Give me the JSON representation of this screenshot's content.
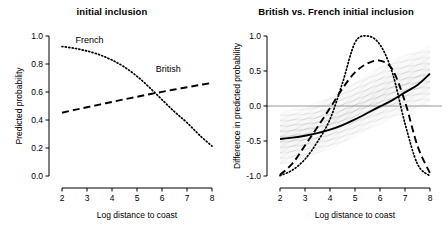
{
  "figure": {
    "background": "#ffffff",
    "panel_count": 2
  },
  "chart_data": [
    {
      "type": "line",
      "panel": "left",
      "title": "initial inclusion",
      "xlabel": "Log distance to coast",
      "ylabel": "Predicted probability",
      "xlim": [
        2,
        8
      ],
      "ylim": [
        0.0,
        1.0
      ],
      "xticks": [
        2,
        3,
        4,
        5,
        6,
        7,
        8
      ],
      "xtick_labels": [
        "2",
        "3",
        "4",
        "5",
        "6",
        "7",
        "8"
      ],
      "yticks": [
        0.0,
        0.2,
        0.4,
        0.6,
        0.8,
        1.0
      ],
      "ytick_labels": [
        "0.0",
        "0.2",
        "0.4",
        "0.6",
        "0.8",
        "1.0"
      ],
      "grid": false,
      "legend": "inline-annotations",
      "x": [
        2.0,
        2.5,
        3.0,
        3.5,
        4.0,
        4.5,
        5.0,
        5.5,
        6.0,
        6.5,
        7.0,
        7.5,
        8.0
      ],
      "series": [
        {
          "name": "French",
          "style": "dotted",
          "color": "#000000",
          "label": "French",
          "label_x": 3.1,
          "label_y": 0.95,
          "values": [
            0.925,
            0.912,
            0.893,
            0.866,
            0.828,
            0.778,
            0.712,
            0.632,
            0.545,
            0.459,
            0.381,
            0.292,
            0.213
          ]
        },
        {
          "name": "British",
          "style": "dashed",
          "color": "#000000",
          "label": "British",
          "label_x": 6.25,
          "label_y": 0.745,
          "values": [
            0.452,
            0.472,
            0.491,
            0.51,
            0.529,
            0.548,
            0.566,
            0.584,
            0.601,
            0.618,
            0.634,
            0.65,
            0.665
          ]
        }
      ]
    },
    {
      "type": "line",
      "panel": "right",
      "title": "British vs. French initial inclusion",
      "xlabel": "Log distance to coast",
      "ylabel": "Difference in predicted probability",
      "xlim": [
        2,
        8
      ],
      "ylim": [
        -1.0,
        1.0
      ],
      "xticks": [
        2,
        3,
        4,
        5,
        6,
        7,
        8
      ],
      "xtick_labels": [
        "2",
        "3",
        "4",
        "5",
        "6",
        "7",
        "8"
      ],
      "yticks": [
        -1.0,
        -0.5,
        0.0,
        0.5,
        1.0
      ],
      "ytick_labels": [
        "-1.0",
        "-0.5",
        "0.0",
        "0.5",
        "1.0"
      ],
      "grid": false,
      "zero_reference_line": 0.0,
      "zero_reference_color": "#8c8c8c",
      "uncertainty_band": {
        "name": "posterior draws",
        "style": "spaghetti",
        "color": "#9a9a9a",
        "lower": [
          -0.86,
          -0.8,
          -0.74,
          -0.68,
          -0.61,
          -0.53,
          -0.44,
          -0.35,
          -0.26,
          -0.18,
          -0.11,
          -0.05,
          0.0
        ],
        "upper": [
          -0.09,
          -0.05,
          -0.01,
          0.05,
          0.13,
          0.23,
          0.34,
          0.45,
          0.56,
          0.65,
          0.73,
          0.8,
          0.86
        ]
      },
      "x": [
        2.0,
        2.5,
        3.0,
        3.5,
        4.0,
        4.5,
        5.0,
        5.5,
        6.0,
        6.5,
        7.0,
        7.5,
        8.0
      ],
      "series": [
        {
          "name": "median difference",
          "style": "solid",
          "color": "#000000",
          "values": [
            -0.472,
            -0.452,
            -0.425,
            -0.388,
            -0.338,
            -0.272,
            -0.191,
            -0.1,
            -0.006,
            0.085,
            0.195,
            0.3,
            0.462
          ]
        },
        {
          "name": "upper credible bound",
          "style": "dashed",
          "color": "#000000",
          "values": [
            -0.985,
            -0.82,
            -0.565,
            -0.3,
            -0.03,
            0.25,
            0.48,
            0.608,
            0.648,
            0.52,
            0.06,
            -0.57,
            -0.96
          ]
        },
        {
          "name": "lower credible bound",
          "style": "dotted",
          "color": "#000000",
          "values": [
            -0.995,
            -0.915,
            -0.76,
            -0.51,
            -0.19,
            0.33,
            0.905,
            1.0,
            0.875,
            0.47,
            -0.25,
            -0.83,
            -1.0
          ]
        }
      ]
    }
  ]
}
